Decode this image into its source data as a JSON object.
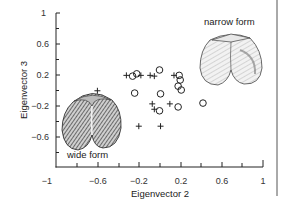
{
  "chart_data": {
    "type": "scatter",
    "title": "",
    "xlabel": "Eigenvector 2",
    "ylabel": "Eigenvector 3",
    "xlim": [
      -1,
      1
    ],
    "ylim": [
      -1,
      1
    ],
    "x_ticks": [
      -1,
      -0.6,
      -0.2,
      0.2,
      0.6,
      1
    ],
    "x_tick_labels": [
      "−1",
      "−0.6",
      "−0.2",
      "0.2",
      "0.6",
      "1"
    ],
    "y_ticks": [
      1,
      0.6,
      0.2,
      -0.2,
      -0.6
    ],
    "y_tick_labels": [
      "1",
      "0.6",
      "0.2",
      "−0.2",
      "−0.6"
    ],
    "grid": false,
    "legend": null,
    "annotations": [
      {
        "text": "narrow form",
        "x": 0.45,
        "y": 0.85
      },
      {
        "text": "wide form",
        "x": -0.88,
        "y": -0.86
      }
    ],
    "series": [
      {
        "name": "plus",
        "marker": "+",
        "points": [
          {
            "x": -0.6,
            "y": -0.01
          },
          {
            "x": -0.32,
            "y": 0.19
          },
          {
            "x": -0.18,
            "y": 0.19
          },
          {
            "x": -0.09,
            "y": 0.19
          },
          {
            "x": -0.05,
            "y": 0.18
          },
          {
            "x": 0.14,
            "y": 0.19
          },
          {
            "x": -0.07,
            "y": -0.18
          },
          {
            "x": -0.05,
            "y": -0.25
          },
          {
            "x": 0.1,
            "y": -0.18
          },
          {
            "x": -0.2,
            "y": -0.47
          },
          {
            "x": 0.01,
            "y": -0.47
          }
        ]
      },
      {
        "name": "circle",
        "marker": "o",
        "points": [
          {
            "x": -0.26,
            "y": 0.18
          },
          {
            "x": -0.22,
            "y": 0.21
          },
          {
            "x": 0.0,
            "y": 0.26
          },
          {
            "x": -0.24,
            "y": -0.04
          },
          {
            "x": 0.01,
            "y": -0.05
          },
          {
            "x": 0.0,
            "y": -0.27
          },
          {
            "x": 0.19,
            "y": 0.19
          },
          {
            "x": 0.2,
            "y": 0.13
          },
          {
            "x": 0.18,
            "y": 0.05
          },
          {
            "x": 0.21,
            "y": 0.0
          },
          {
            "x": 0.18,
            "y": -0.22
          },
          {
            "x": 0.42,
            "y": -0.17
          }
        ]
      }
    ]
  },
  "labels": {
    "xlabel": "Eigenvector 2",
    "ylabel": "Eigenvector 3",
    "narrow": "narrow form",
    "wide": "wide form",
    "xt0": "−1",
    "xt1": "−0.6",
    "xt2": "−0.2",
    "xt3": "0.2",
    "xt4": "0.6",
    "xt5": "1",
    "yt0": "1",
    "yt1": "0.6",
    "yt2": "0.2",
    "yt3": "−0.2",
    "yt4": "−0.6"
  },
  "illustrations": {
    "narrow_shell": "narrow-shell-illustration",
    "wide_shell": "wide-shell-illustration"
  }
}
